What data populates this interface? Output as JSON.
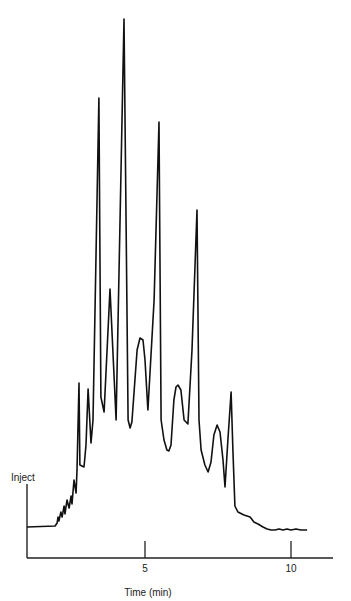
{
  "chart_data": {
    "type": "line",
    "title": "",
    "xlabel": "Time (min)",
    "ylabel": "",
    "annotations": [
      {
        "text": "Inject",
        "x": 0.96
      }
    ],
    "x_ticks": [
      5,
      10
    ],
    "x_tick_labels": [
      "5",
      "10"
    ],
    "xlim": [
      0.96,
      11.45
    ],
    "grid": false,
    "legend": null,
    "y_units": "relative detector signal (arbitrary)",
    "series": [
      {
        "name": "chromatogram",
        "x": [
          0.96,
          1.92,
          1.99,
          2.02,
          2.05,
          2.12,
          2.16,
          2.23,
          2.26,
          2.33,
          2.4,
          2.47,
          2.5,
          2.57,
          2.64,
          2.67,
          2.74,
          2.77,
          2.91,
          2.98,
          3.05,
          3.15,
          3.22,
          3.42,
          3.49,
          3.6,
          3.8,
          4.01,
          4.28,
          4.42,
          4.49,
          4.55,
          4.73,
          4.83,
          4.93,
          5.0,
          5.1,
          5.31,
          5.48,
          5.55,
          5.65,
          5.75,
          5.82,
          5.89,
          5.99,
          6.06,
          6.13,
          6.23,
          6.34,
          6.47,
          6.61,
          6.78,
          6.85,
          6.92,
          7.05,
          7.16,
          7.26,
          7.36,
          7.47,
          7.57,
          7.67,
          7.74,
          7.84,
          7.95,
          8.01,
          8.08,
          8.18,
          8.39,
          8.6,
          8.73,
          8.87,
          9.04,
          9.18,
          9.32,
          9.45,
          9.59,
          9.73,
          9.86,
          10.0,
          10.17,
          10.34,
          10.55
        ],
        "values": [
          31,
          32,
          35,
          41,
          37,
          46,
          41,
          52,
          44,
          58,
          50,
          62,
          54,
          78,
          65,
          88,
          175,
          93,
          91,
          113,
          169,
          115,
          138,
          460,
          161,
          146,
          269,
          138,
          539,
          138,
          130,
          136,
          208,
          220,
          218,
          198,
          148,
          258,
          436,
          138,
          118,
          108,
          107,
          113,
          158,
          171,
          173,
          168,
          138,
          134,
          208,
          348,
          138,
          108,
          93,
          86,
          96,
          123,
          133,
          126,
          98,
          71,
          118,
          166,
          108,
          52,
          46,
          43,
          41,
          36,
          34,
          31,
          29,
          28,
          28,
          29,
          28,
          29,
          28,
          29,
          28,
          28
        ]
      }
    ]
  },
  "labels": {
    "inject": "Inject",
    "xlabel": "Time (min)",
    "tick_5": "5",
    "tick_10": "10"
  },
  "colors": {
    "line": "#111111",
    "axis": "#222222",
    "background": "#ffffff"
  }
}
